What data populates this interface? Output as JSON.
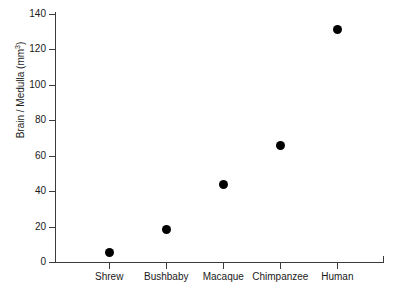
{
  "chart_data": {
    "type": "scatter",
    "title": "",
    "xlabel": "",
    "ylabel": "Brain / Medulla (mm3)",
    "ylabel_base": "Brain / Medulla (mm",
    "ylabel_sup": "3",
    "ylabel_tail": ")",
    "categories": [
      "Shrew",
      "Bushbaby",
      "Macaque",
      "Chimpanzee",
      "Human"
    ],
    "values": [
      5.6,
      18.1,
      44,
      65.5,
      131
    ],
    "ylim": [
      0,
      140
    ],
    "yticks": [
      0,
      20,
      40,
      60,
      80,
      100,
      120,
      140
    ],
    "ytick_labels": [
      "0",
      "20",
      "40",
      "60",
      "80",
      "100",
      "120",
      "140"
    ],
    "grid": false,
    "legend": null,
    "marker": {
      "shape": "circle",
      "color": "#000000",
      "size_px": 9
    },
    "axis_color": "#3b3b3b",
    "background": "#ffffff",
    "points": [
      {
        "category": "Shrew",
        "value": 5.6
      },
      {
        "category": "Bushbaby",
        "value": 18.1
      },
      {
        "category": "Macaque",
        "value": 44
      },
      {
        "category": "Chimpanzee",
        "value": 65.5
      },
      {
        "category": "Human",
        "value": 131
      }
    ]
  }
}
